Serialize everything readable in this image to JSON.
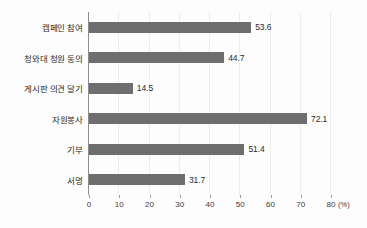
{
  "chart_data": {
    "type": "bar",
    "orientation": "horizontal",
    "title": "",
    "xlabel": "(%)",
    "ylabel": "",
    "categories": [
      "캠페인 참여",
      "청와대 청원 동의",
      "게시판 의견 달기",
      "자원봉사",
      "기부",
      "서명"
    ],
    "values": [
      53.6,
      44.7,
      14.5,
      72.1,
      51.4,
      31.7
    ],
    "value_labels": [
      "53.6",
      "44.7",
      "14.5",
      "72.1",
      "51.4",
      "31.7"
    ],
    "xlim": [
      0,
      80
    ],
    "xticks": [
      0,
      10,
      20,
      30,
      40,
      50,
      60,
      70,
      80
    ],
    "xtick_labels": [
      "0",
      "10",
      "20",
      "30",
      "40",
      "50",
      "60",
      "70",
      "80"
    ],
    "unit": "(%)",
    "grid": true,
    "legend": null,
    "series": [
      {
        "name": "",
        "values": [
          53.6,
          44.7,
          14.5,
          72.1,
          51.4,
          31.7
        ]
      }
    ]
  },
  "style": {
    "bar_color": "#6e6e6e",
    "axis_color": "#8d8d8d",
    "grid_color": "#ededed",
    "text_color": "#2c2c2c",
    "background": "#fdfdfd"
  }
}
